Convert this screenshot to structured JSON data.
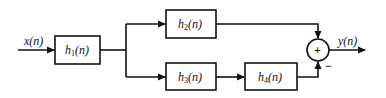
{
  "diagram": {
    "type": "block-diagram",
    "input": {
      "label": "x(n)"
    },
    "output": {
      "label": "y(n)"
    },
    "blocks": [
      {
        "id": "h1",
        "label": "h",
        "sub": "1",
        "arg": "(n)"
      },
      {
        "id": "h2",
        "label": "h",
        "sub": "2",
        "arg": "(n)"
      },
      {
        "id": "h3",
        "label": "h",
        "sub": "3",
        "arg": "(n)"
      },
      {
        "id": "h4",
        "label": "h",
        "sub": "4",
        "arg": "(n)"
      }
    ],
    "summer": {
      "symbol": "+",
      "inputs": [
        {
          "from": "h2",
          "sign": "+"
        },
        {
          "from": "h4",
          "sign": "−"
        }
      ]
    },
    "minus_sign": "−",
    "connections": [
      "x(n) → h1",
      "h1 → h2",
      "h1 → h3",
      "h3 → h4",
      "h2 → summer (+)",
      "h4 → summer (−)",
      "summer → y(n)"
    ]
  }
}
